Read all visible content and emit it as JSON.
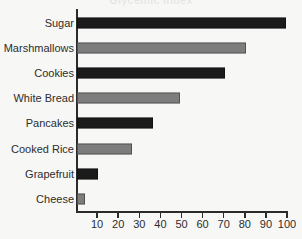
{
  "chart_data": {
    "type": "bar",
    "orientation": "horizontal",
    "title": "Glycemic Index",
    "subtitle": "",
    "xlabel": "",
    "ylabel": "",
    "categories": [
      "Sugar",
      "Marshmallows",
      "Cookies",
      "White Bread",
      "Pancakes",
      "Cooked Rice",
      "Grapefruit",
      "Cheese"
    ],
    "values": [
      99,
      80,
      70,
      49,
      36,
      26,
      10,
      4
    ],
    "xlim": [
      0,
      100
    ],
    "ylim": null,
    "x_ticks": [
      10,
      20,
      30,
      40,
      50,
      60,
      70,
      80,
      90,
      100
    ],
    "x_tick_labels": [
      "10",
      "20",
      "30",
      "40",
      "50",
      "60",
      "70",
      "80",
      "90",
      "100"
    ],
    "grid": false,
    "legend": null,
    "legend_position": "none",
    "annotations": [],
    "series": [
      {
        "name": "value",
        "values": [
          99,
          80,
          70,
          49,
          36,
          26,
          10,
          4
        ]
      }
    ],
    "bar_colors": [
      "#1b1b1b",
      "#7d7d7d",
      "#1b1b1b",
      "#7d7d7d",
      "#1b1b1b",
      "#7d7d7d",
      "#1b1b1b",
      "#7d7d7d"
    ]
  },
  "style": {
    "background": "#f7f7f6",
    "axis_color": "#2b2b2b",
    "text_color": "#2d2d2d",
    "bar_dark": "#1b1b1b",
    "bar_light": "#7d7d7d"
  }
}
